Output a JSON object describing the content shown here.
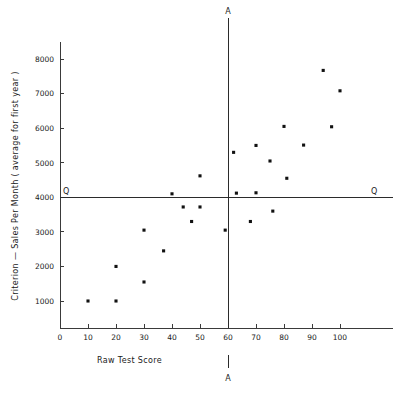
{
  "chart_data": {
    "type": "scatter",
    "title": "",
    "xlabel": "Raw Test Score",
    "ylabel": "Criterion — Sales Per Month  ( average for first year )",
    "xlim": [
      0,
      107
    ],
    "ylim": [
      0,
      8700
    ],
    "grid": false,
    "legend": null,
    "xticks": [
      0,
      10,
      20,
      30,
      40,
      50,
      60,
      70,
      80,
      90,
      100
    ],
    "xticklabels": [
      "0",
      "10",
      "20",
      "30",
      "40",
      "50",
      "60",
      "70",
      "80",
      "90",
      "100"
    ],
    "yticks": [
      1000,
      2000,
      3000,
      4000,
      5000,
      6000,
      7000,
      8000
    ],
    "yticklabels": [
      "1000",
      "2000",
      "3000",
      "4000",
      "5000",
      "6000",
      "7000",
      "8000"
    ],
    "points": [
      {
        "x": 10,
        "y": 1000
      },
      {
        "x": 20,
        "y": 1000
      },
      {
        "x": 20,
        "y": 2000
      },
      {
        "x": 30,
        "y": 1550
      },
      {
        "x": 30,
        "y": 3050
      },
      {
        "x": 37,
        "y": 2450
      },
      {
        "x": 40,
        "y": 4100
      },
      {
        "x": 44,
        "y": 3720
      },
      {
        "x": 47,
        "y": 3300
      },
      {
        "x": 50,
        "y": 3720
      },
      {
        "x": 50,
        "y": 4620
      },
      {
        "x": 59,
        "y": 3050
      },
      {
        "x": 62,
        "y": 5300
      },
      {
        "x": 63,
        "y": 4120
      },
      {
        "x": 68,
        "y": 3300
      },
      {
        "x": 70,
        "y": 4130
      },
      {
        "x": 70,
        "y": 5500
      },
      {
        "x": 75,
        "y": 5050
      },
      {
        "x": 76,
        "y": 3600
      },
      {
        "x": 80,
        "y": 6050
      },
      {
        "x": 81,
        "y": 4550
      },
      {
        "x": 87,
        "y": 5510
      },
      {
        "x": 94,
        "y": 7670
      },
      {
        "x": 97,
        "y": 6040
      },
      {
        "x": 100,
        "y": 7080
      }
    ],
    "reference_lines": {
      "vertical": {
        "label": "A",
        "value": 60,
        "description": "selection cutoff on Raw Test Score",
        "label_top": "A",
        "label_bottom": "A"
      },
      "horizontal": {
        "label": "Q",
        "value": 4000,
        "description": "criterion cutoff on Sales Per Month",
        "label_left": "Q",
        "label_right": "Q"
      }
    },
    "colors": {
      "point": "#111111",
      "axis": "#3a3a3a",
      "reference_line": "#2b2b2b",
      "background": "#ffffff"
    }
  }
}
